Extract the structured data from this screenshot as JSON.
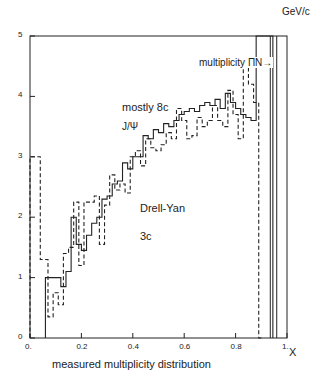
{
  "chart_data": {
    "type": "line",
    "title": "",
    "xlabel": "measured multiplicity distribution",
    "xaxis_symbol": "X",
    "ylabel": "GeV/c",
    "xlim": [
      0,
      1
    ],
    "ylim": [
      0,
      5
    ],
    "grid": false,
    "x_ticks": [
      "0.",
      "0.2",
      "0.4",
      "0.6",
      "0.8",
      "1."
    ],
    "x_tick_values": [
      0,
      0.2,
      0.4,
      0.6,
      0.8,
      1.0
    ],
    "y_ticks": [
      "0",
      "1",
      "2",
      "3",
      "4",
      "5"
    ],
    "y_tick_values": [
      0,
      1,
      2,
      3,
      4,
      5
    ],
    "annotations": [
      {
        "text": "mostly 8c",
        "x": 0.42,
        "y": 3.95
      },
      {
        "text": "J/Ψ",
        "x": 0.42,
        "y": 3.6
      },
      {
        "text": "Drell-Yan",
        "x": 0.49,
        "y": 2.12
      },
      {
        "text": "3c",
        "x": 0.49,
        "y": 1.65
      },
      {
        "text": "multiplicity ΠN→",
        "x": 0.7,
        "y": 4.35
      }
    ],
    "series": [
      {
        "name": "J/Ψ (mostly 8c)",
        "style": "solid",
        "bin_edges": [
          0.06,
          0.12,
          0.14,
          0.16,
          0.18,
          0.2,
          0.22,
          0.24,
          0.26,
          0.28,
          0.3,
          0.32,
          0.34,
          0.36,
          0.38,
          0.4,
          0.42,
          0.44,
          0.46,
          0.48,
          0.5,
          0.52,
          0.54,
          0.56,
          0.58,
          0.6,
          0.62,
          0.64,
          0.66,
          0.68,
          0.7,
          0.72,
          0.74,
          0.76,
          0.78,
          0.8,
          0.82,
          0.84,
          0.86,
          0.88,
          0.9,
          0.925,
          0.945
        ],
        "values": [
          1.0,
          0.85,
          1.1,
          2.0,
          1.55,
          1.45,
          1.7,
          1.9,
          2.0,
          2.3,
          2.35,
          2.55,
          2.6,
          2.9,
          2.8,
          3.0,
          3.0,
          3.35,
          3.3,
          3.45,
          3.4,
          3.55,
          3.5,
          3.6,
          3.7,
          3.75,
          3.8,
          3.75,
          3.85,
          3.9,
          3.85,
          3.95,
          3.8,
          4.05,
          3.9,
          3.8,
          3.7,
          3.65,
          3.6,
          5.0,
          5.0,
          5.0
        ]
      },
      {
        "name": "Drell-Yan (3c)",
        "style": "dashed",
        "bin_edges": [
          0.0,
          0.04,
          0.07,
          0.09,
          0.11,
          0.13,
          0.15,
          0.17,
          0.19,
          0.21,
          0.23,
          0.25,
          0.27,
          0.29,
          0.31,
          0.33,
          0.35,
          0.37,
          0.39,
          0.41,
          0.43,
          0.45,
          0.47,
          0.49,
          0.51,
          0.53,
          0.55,
          0.57,
          0.59,
          0.61,
          0.63,
          0.65,
          0.67,
          0.69,
          0.71,
          0.73,
          0.75,
          0.77,
          0.79,
          0.81,
          0.83,
          0.85,
          0.87,
          0.89,
          0.905
        ],
        "values": [
          3.0,
          1.3,
          0.35,
          0.75,
          0.55,
          1.4,
          1.5,
          2.25,
          1.2,
          2.25,
          2.25,
          2.35,
          1.55,
          2.2,
          2.7,
          2.45,
          2.55,
          2.4,
          3.0,
          3.1,
          2.85,
          3.3,
          3.15,
          3.1,
          3.2,
          3.4,
          3.3,
          3.8,
          3.6,
          3.3,
          3.35,
          3.65,
          3.5,
          3.6,
          3.85,
          3.6,
          3.5,
          4.1,
          3.7,
          3.3,
          4.55,
          4.2,
          3.9,
          0.0
        ]
      }
    ],
    "vertical_lines": [
      0.935,
      0.96
    ]
  },
  "labels": {
    "unit": "GeV/c",
    "x_title": "measured multiplicity distribution",
    "x_symbol": "X",
    "mostly": "mostly 8c",
    "jpsi": "J/Ψ",
    "dy": "Drell-Yan",
    "dy_c": "3c",
    "mult": "multiplicity ΠN→"
  }
}
